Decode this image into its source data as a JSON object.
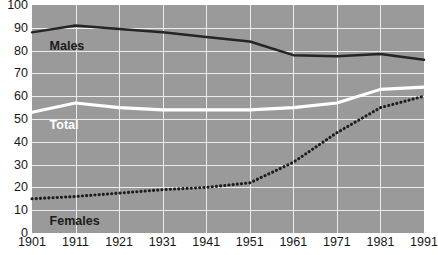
{
  "title": "",
  "chart_data": {
    "type": "line",
    "title": "",
    "subtitle": "",
    "xlabel": "",
    "ylabel": "",
    "x": [
      1901,
      1911,
      1921,
      1931,
      1941,
      1951,
      1961,
      1971,
      1981,
      1991
    ],
    "categories": [
      "1901",
      "1911",
      "1921",
      "1931",
      "1941",
      "1951",
      "1961",
      "1971",
      "1981",
      "1991"
    ],
    "xlim": [
      1901,
      1991
    ],
    "ylim": [
      0,
      100
    ],
    "yticks": [
      0,
      10,
      20,
      30,
      40,
      50,
      60,
      70,
      80,
      90,
      100
    ],
    "xticks": [
      1901,
      1911,
      1921,
      1931,
      1941,
      1951,
      1961,
      1971,
      1981,
      1991
    ],
    "grid": true,
    "legend": "inline-labels",
    "plot_background": "#9a9a9a",
    "gridline_color": "#ececed",
    "series": [
      {
        "name": "Males",
        "label": "Males",
        "color": "#252525",
        "style": "solid",
        "values": [
          88,
          91,
          89.5,
          88,
          86,
          84,
          78,
          77.5,
          78.5,
          76
        ]
      },
      {
        "name": "Total",
        "label": "Total",
        "color": "#ffffff",
        "style": "solid",
        "values": [
          53,
          57,
          55,
          54,
          54,
          54,
          55,
          57,
          63,
          64
        ]
      },
      {
        "name": "Females",
        "label": "Females",
        "color": "#1e1e1e",
        "style": "dotted",
        "values": [
          15,
          16,
          17.5,
          19,
          20,
          22,
          31,
          44,
          55,
          60
        ]
      }
    ]
  },
  "labels": {
    "males": "Males",
    "total": "Total",
    "females": "Females"
  }
}
